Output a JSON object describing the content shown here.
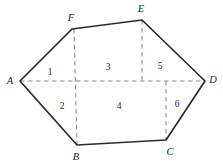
{
  "figure": {
    "kind": "hexagon-partition-diagram",
    "canvas": {
      "width": 223,
      "height": 167,
      "background": "#ffffff"
    },
    "colors": {
      "solid_edge": "#2b2b2b",
      "dashed_line": "#8d8d8d",
      "label_text": "#1c1c1c",
      "region_text": "#2a2a2a"
    },
    "vertices": [
      {
        "id": "A",
        "label": "A",
        "x": 20,
        "y": 81,
        "label_x": 10,
        "label_y": 81
      },
      {
        "id": "B",
        "label": "B",
        "x": 77,
        "y": 145,
        "label_x": 76,
        "label_y": 157
      },
      {
        "id": "C",
        "label": "C",
        "x": 166,
        "y": 140,
        "label_x": 170,
        "label_y": 152
      },
      {
        "id": "D",
        "label": "D",
        "x": 205,
        "y": 81,
        "label_x": 213,
        "label_y": 80
      },
      {
        "id": "E",
        "label": "E",
        "x": 142,
        "y": 20,
        "label_x": 141,
        "label_y": 9
      },
      {
        "id": "F",
        "label": "F",
        "x": 72,
        "y": 29,
        "label_x": 71,
        "label_y": 18
      }
    ],
    "outline_path": "M 20 81 L 72 29 L 142 20 L 205 81 L 166 140 L 77 145 Z",
    "dashed_segments": [
      {
        "name": "diagonal-A-D",
        "x1": 20,
        "y1": 81,
        "x2": 205,
        "y2": 81
      },
      {
        "name": "vertical-F-B",
        "x1": 74,
        "y1": 29,
        "x2": 77,
        "y2": 145
      },
      {
        "name": "vertical-E-to-diagonal",
        "x1": 142,
        "y1": 20,
        "x2": 142,
        "y2": 81
      },
      {
        "name": "vertical-C-to-diagonal",
        "x1": 166,
        "y1": 81,
        "x2": 166,
        "y2": 140
      }
    ],
    "regions": [
      {
        "id": "r1",
        "label": "1",
        "x": 50,
        "y": 73
      },
      {
        "id": "r2",
        "label": "2",
        "x": 62,
        "y": 107
      },
      {
        "id": "r3",
        "label": "3",
        "x": 108,
        "y": 68
      },
      {
        "id": "r4",
        "label": "4",
        "x": 119,
        "y": 107
      },
      {
        "id": "r5",
        "label": "5",
        "x": 160,
        "y": 67
      },
      {
        "id": "r6",
        "label": "6",
        "x": 177,
        "y": 105
      }
    ]
  }
}
